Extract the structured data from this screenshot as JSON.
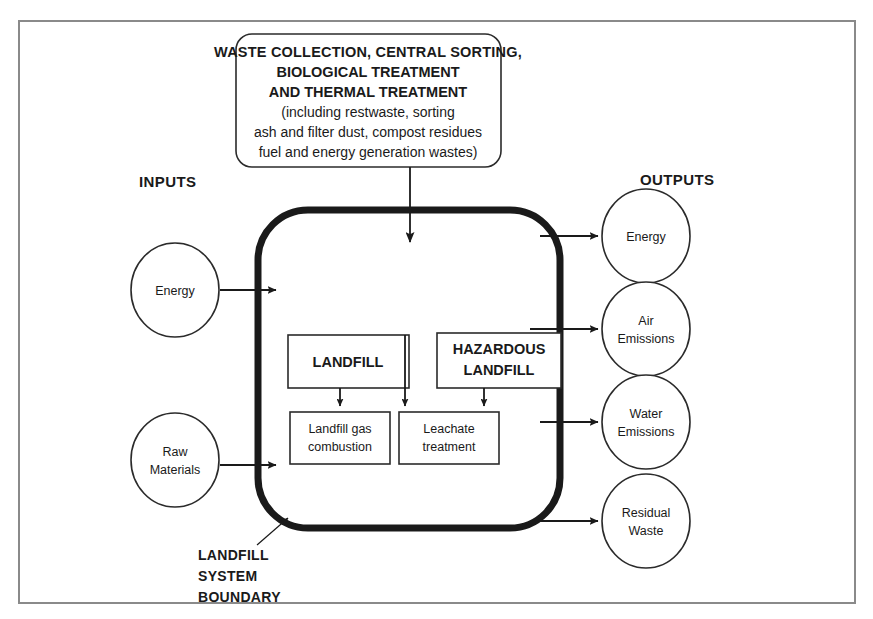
{
  "diagram": {
    "title_block": {
      "name": "waste-system-callout",
      "lines": [
        "WASTE COLLECTION, CENTRAL SORTING,",
        "BIOLOGICAL TREATMENT",
        "AND THERMAL TREATMENT",
        "(including restwaste, sorting",
        "ash and filter dust, compost residues",
        "fuel and energy generation wastes)"
      ]
    },
    "section_labels": {
      "inputs": "INPUTS",
      "outputs": "OUTPUTS"
    },
    "boundary_label": {
      "lines": [
        "LANDFILL",
        "SYSTEM",
        "BOUNDARY"
      ]
    },
    "inputs": [
      {
        "id": "energy-in",
        "lines": [
          "Energy"
        ]
      },
      {
        "id": "raw-materials-in",
        "lines": [
          "Raw",
          "Materials"
        ]
      }
    ],
    "outputs": [
      {
        "id": "energy-out",
        "lines": [
          "Energy"
        ]
      },
      {
        "id": "air-emissions-out",
        "lines": [
          "Air",
          "Emissions"
        ]
      },
      {
        "id": "water-emissions-out",
        "lines": [
          "Water",
          "Emissions"
        ]
      },
      {
        "id": "residual-waste-out",
        "lines": [
          "Residual",
          "Waste"
        ]
      }
    ],
    "processes": [
      {
        "id": "landfill",
        "lines": [
          "LANDFILL"
        ]
      },
      {
        "id": "hazardous-landfill",
        "lines": [
          "HAZARDOUS",
          "LANDFILL"
        ]
      },
      {
        "id": "landfill-gas-combustion",
        "lines": [
          "Landfill gas",
          "combustion"
        ]
      },
      {
        "id": "leachate-treatment",
        "lines": [
          "Leachate",
          "treatment"
        ]
      }
    ],
    "colors": {
      "frame_stroke": "#8a8a8a",
      "boundary_stroke": "#1a1a1a",
      "line_stroke": "#1a1a1a",
      "text": "#1a1a1a",
      "background": "#ffffff"
    }
  }
}
